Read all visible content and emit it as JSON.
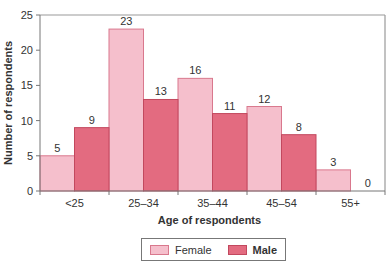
{
  "chart_data": {
    "type": "bar",
    "xlabel": "Age of respondents",
    "ylabel": "Number of respondents",
    "categories": [
      "<25",
      "25–34",
      "35–44",
      "45–54",
      "55+"
    ],
    "series": [
      {
        "name": "Female",
        "values": [
          5,
          23,
          16,
          12,
          3
        ],
        "color": "#f5bfcc",
        "stroke": "#d9788d"
      },
      {
        "name": "Male",
        "values": [
          9,
          13,
          11,
          8,
          0
        ],
        "color": "#e36b80",
        "stroke": "#c2485e"
      }
    ],
    "ylim": [
      0,
      25
    ],
    "yticks": [
      0,
      5,
      10,
      15,
      20,
      25
    ],
    "grid": false,
    "legend_position": "bottom",
    "bar_gap": 0,
    "data_labels": true
  },
  "legend": {
    "female_label": "Female",
    "male_label": "Male"
  },
  "axes": {
    "xlabel": "Age of respondents",
    "ylabel": "Number of respondents"
  }
}
